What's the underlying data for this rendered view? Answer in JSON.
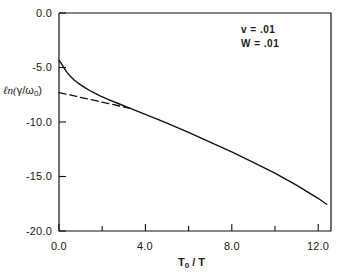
{
  "chart_data": {
    "type": "line",
    "title": "",
    "xlabel": "T₀ / T",
    "ylabel": "ℓn(γ/ω₀)",
    "xlim": [
      0.0,
      12.6
    ],
    "ylim": [
      -20.0,
      0.0
    ],
    "grid": false,
    "legend": "none",
    "xticks": [
      "0.0",
      "4.0",
      "8.0",
      "12.0"
    ],
    "xtick_values": [
      0.0,
      4.0,
      8.0,
      12.0
    ],
    "xminor_tick_values": [
      2.0,
      6.0,
      10.0
    ],
    "yticks": [
      "0.0",
      "-5.0",
      "-10.0",
      "-15.0",
      "-20.0"
    ],
    "ytick_values": [
      0.0,
      -5.0,
      -10.0,
      -15.0,
      -20.0
    ],
    "series": [
      {
        "name": "solid-curve",
        "style": "solid",
        "color": "#111111",
        "x": [
          0.0,
          0.1,
          0.2,
          0.35,
          0.5,
          0.7,
          0.9,
          1.2,
          1.5,
          1.9,
          2.3,
          2.8,
          3.3,
          4.0,
          5.0,
          6.0,
          7.0,
          8.0,
          9.0,
          10.0,
          11.0,
          12.0,
          12.4
        ],
        "y": [
          -4.35,
          -4.6,
          -4.95,
          -5.4,
          -5.75,
          -6.15,
          -6.45,
          -6.85,
          -7.2,
          -7.6,
          -7.95,
          -8.35,
          -8.75,
          -9.3,
          -10.1,
          -10.95,
          -11.85,
          -12.75,
          -13.7,
          -14.7,
          -15.8,
          -17.0,
          -17.55
        ]
      },
      {
        "name": "dashed-asymptote",
        "style": "dashed",
        "color": "#111111",
        "x": [
          0.0,
          3.3
        ],
        "y": [
          -7.3,
          -8.75
        ]
      }
    ],
    "annotations": [
      {
        "name": "annotation-v",
        "symbol": "v",
        "operator": "=",
        "value": ".01",
        "text": "v  =  .01"
      },
      {
        "name": "annotation-W",
        "symbol": "W",
        "operator": "=",
        "value": ".01",
        "text": "W  =  .01"
      }
    ]
  },
  "axes": {
    "ylabel_parts": {
      "pre": "ℓn(",
      "num": "γ",
      "slash": "/",
      "den": "ω",
      "densub": "0",
      "post": ")"
    },
    "xlabel_parts": {
      "base": "T",
      "sub": "0",
      "rest": " / T"
    }
  }
}
